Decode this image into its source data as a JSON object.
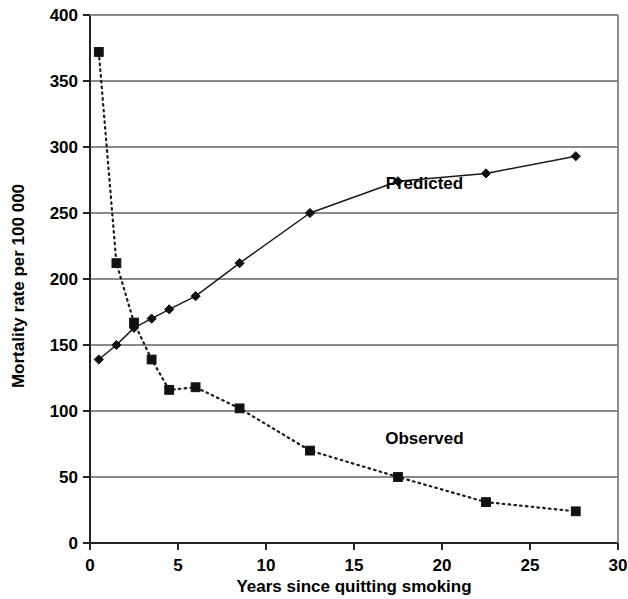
{
  "chart_data": {
    "type": "line",
    "title": "",
    "xlabel": "Years since quitting smoking",
    "ylabel": "Mortality rate per 100 000",
    "xlim": [
      0,
      30
    ],
    "ylim": [
      0,
      400
    ],
    "xticks": [
      0,
      5,
      10,
      15,
      20,
      25,
      30
    ],
    "ytokens": [
      0,
      50,
      100,
      150,
      200,
      250,
      300,
      350,
      400
    ],
    "yticks": [
      0,
      50,
      100,
      150,
      200,
      250,
      300,
      350,
      400
    ],
    "xtick_labels": [
      "0",
      "5",
      "10",
      "15",
      "20",
      "25",
      "30"
    ],
    "ytick_labels": [
      "0",
      "50",
      "100",
      "150",
      "200",
      "250",
      "300",
      "350",
      "400"
    ],
    "grid": "horizontal",
    "legend_position": "inline-annotations",
    "series": [
      {
        "name": "Predicted",
        "marker": "diamond",
        "linestyle": "solid",
        "color": "#111111",
        "label_x": 19.0,
        "label_y": 268,
        "x": [
          0.5,
          1.5,
          2.5,
          3.5,
          4.5,
          6.0,
          8.5,
          12.5,
          17.5,
          22.5,
          27.6
        ],
        "values": [
          139,
          150,
          163,
          170,
          177,
          187,
          212,
          250,
          274,
          280,
          293
        ]
      },
      {
        "name": "Observed",
        "marker": "square",
        "linestyle": "dotted",
        "color": "#111111",
        "label_x": 19.0,
        "label_y": 75,
        "x": [
          0.5,
          1.5,
          2.5,
          3.5,
          4.5,
          6.0,
          8.5,
          12.5,
          17.5,
          22.5,
          27.6
        ],
        "values": [
          372,
          212,
          167,
          139,
          116,
          118,
          102,
          70,
          50,
          31,
          24
        ]
      }
    ]
  },
  "axes": {
    "x_title": "Years since quitting smoking",
    "y_title": "Mortality rate per 100 000"
  }
}
